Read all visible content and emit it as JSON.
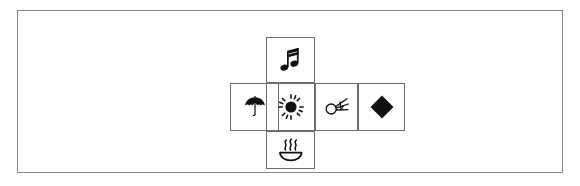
{
  "figure": {
    "background_color": "#ffffff",
    "frame_color": "#8a8a8a",
    "cell_border_color": "#6e6e6e",
    "icon_color": "#111111",
    "layout": "cross",
    "cells": [
      {
        "position": "top",
        "icon_name": "music-note-icon",
        "icon_label": "beamed eighth notes",
        "glyph": "♫"
      },
      {
        "position": "left",
        "icon_name": "umbrella-icon",
        "icon_label": "umbrella",
        "glyph": "☂"
      },
      {
        "position": "center",
        "icon_name": "sun-icon",
        "icon_label": "sun with rays",
        "glyph": "☀"
      },
      {
        "position": "right-inner",
        "icon_name": "firework-icon",
        "icon_label": "circle with radiating rays",
        "glyph": "✽"
      },
      {
        "position": "right-outer",
        "icon_name": "diamond-icon",
        "icon_label": "filled diamond",
        "glyph": "◆"
      },
      {
        "position": "bottom",
        "icon_name": "hot-springs-icon",
        "icon_label": "hot springs",
        "glyph": "♨"
      }
    ]
  }
}
